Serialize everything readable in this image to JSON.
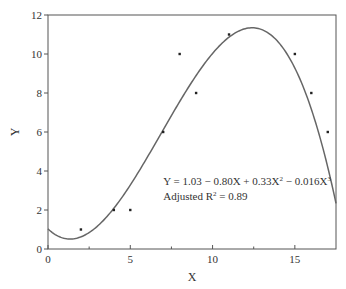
{
  "chart_data": {
    "type": "scatter",
    "title": "",
    "xlabel": "X",
    "ylabel": "Y",
    "xlim": [
      0,
      17.5
    ],
    "ylim": [
      0,
      12
    ],
    "x_ticks": [
      0,
      5,
      10,
      15
    ],
    "x_minor_ticks": [
      2.5,
      7.5,
      12.5
    ],
    "y_ticks": [
      0,
      2,
      4,
      6,
      8,
      10,
      12
    ],
    "grid": false,
    "series": [
      {
        "name": "observations",
        "type": "scatter",
        "points": [
          {
            "x": 2,
            "y": 1
          },
          {
            "x": 4,
            "y": 2
          },
          {
            "x": 5,
            "y": 2
          },
          {
            "x": 7,
            "y": 6
          },
          {
            "x": 8,
            "y": 10
          },
          {
            "x": 9,
            "y": 8
          },
          {
            "x": 11,
            "y": 11
          },
          {
            "x": 15,
            "y": 10
          },
          {
            "x": 16,
            "y": 8
          },
          {
            "x": 17,
            "y": 6
          }
        ]
      },
      {
        "name": "cubic fit",
        "type": "line",
        "coefficients": [
          1.03,
          -0.8,
          0.33,
          -0.016
        ]
      }
    ],
    "annotations": [
      {
        "text_parts": [
          "Y = 1.03 − 0.80X + 0.33X",
          "2",
          " − 0.016X",
          "3"
        ],
        "x": 7.0,
        "y": 3.3
      },
      {
        "text_parts": [
          "Adjusted R",
          "2",
          " = 0.89"
        ],
        "x": 7.0,
        "y": 2.5
      }
    ]
  },
  "colors": {
    "axis": "#555555",
    "curve": "#666666",
    "point": "#222222",
    "text": "#333333"
  }
}
